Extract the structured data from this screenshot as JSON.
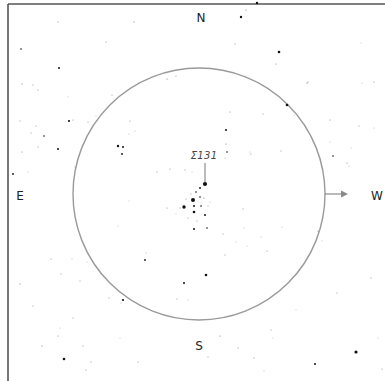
{
  "chart": {
    "width": 385,
    "height": 381,
    "background": "#ffffff",
    "frame": {
      "color": "#555555",
      "top_y": 4,
      "left_x": 8,
      "stroke_width": 1.6
    },
    "field_circle": {
      "cx": 199,
      "cy": 194,
      "r": 126,
      "color": "#9a9a9a",
      "stroke_width": 1.4
    },
    "direction_arrow": {
      "x1": 325,
      "y1": 194,
      "x2": 348,
      "y2": 194,
      "color": "#8a8a8a"
    },
    "pointer_line": {
      "x1": 205,
      "y1": 163,
      "x2": 205,
      "y2": 182,
      "color": "#666666"
    },
    "star_color": "#111111"
  },
  "labels": {
    "north": {
      "text": "N",
      "x": 201,
      "y": 18
    },
    "south": {
      "text": "S",
      "x": 199,
      "y": 346
    },
    "east": {
      "text": "E",
      "x": 20,
      "y": 196
    },
    "west": {
      "text": "W",
      "x": 377,
      "y": 196
    },
    "target": {
      "text": "Σ131",
      "x": 204,
      "y": 156
    }
  },
  "stars": [
    {
      "x": 257,
      "y": 3,
      "r": 1.2
    },
    {
      "x": 241,
      "y": 17,
      "r": 1.2
    },
    {
      "x": 246,
      "y": 10,
      "r": 0.6
    },
    {
      "x": 58,
      "y": 22,
      "r": 0.5
    },
    {
      "x": 134,
      "y": 22,
      "r": 0.6
    },
    {
      "x": 21,
      "y": 49,
      "r": 0.8
    },
    {
      "x": 106,
      "y": 42,
      "r": 0.5
    },
    {
      "x": 235,
      "y": 44,
      "r": 0.5
    },
    {
      "x": 279,
      "y": 52,
      "r": 1.3
    },
    {
      "x": 361,
      "y": 43,
      "r": 0.4
    },
    {
      "x": 59,
      "y": 68,
      "r": 1.0
    },
    {
      "x": 22,
      "y": 84,
      "r": 0.6
    },
    {
      "x": 33,
      "y": 85,
      "r": 0.5
    },
    {
      "x": 38,
      "y": 90,
      "r": 0.5
    },
    {
      "x": 68,
      "y": 97,
      "r": 0.4
    },
    {
      "x": 279,
      "y": 52,
      "r": 0.5
    },
    {
      "x": 276,
      "y": 64,
      "r": 0.5
    },
    {
      "x": 307,
      "y": 83,
      "r": 0.6
    },
    {
      "x": 374,
      "y": 82,
      "r": 0.5
    },
    {
      "x": 69,
      "y": 121,
      "r": 1.1
    },
    {
      "x": 73,
      "y": 120,
      "r": 0.5
    },
    {
      "x": 20,
      "y": 121,
      "r": 0.5
    },
    {
      "x": 36,
      "y": 126,
      "r": 0.5
    },
    {
      "x": 31,
      "y": 133,
      "r": 0.5
    },
    {
      "x": 44,
      "y": 136,
      "r": 0.8
    },
    {
      "x": 58,
      "y": 149,
      "r": 1.0
    },
    {
      "x": 38,
      "y": 147,
      "r": 0.5
    },
    {
      "x": 22,
      "y": 152,
      "r": 0.5
    },
    {
      "x": 13,
      "y": 174,
      "r": 0.9
    },
    {
      "x": 28,
      "y": 172,
      "r": 0.4
    },
    {
      "x": 112,
      "y": 95,
      "r": 0.5
    },
    {
      "x": 167,
      "y": 79,
      "r": 0.6
    },
    {
      "x": 176,
      "y": 76,
      "r": 0.5
    },
    {
      "x": 96,
      "y": 116,
      "r": 0.4
    },
    {
      "x": 130,
      "y": 121,
      "r": 0.5
    },
    {
      "x": 88,
      "y": 122,
      "r": 0.5
    },
    {
      "x": 287,
      "y": 105,
      "r": 1.3
    },
    {
      "x": 362,
      "y": 83,
      "r": 0.4
    },
    {
      "x": 308,
      "y": 82,
      "r": 0.5
    },
    {
      "x": 330,
      "y": 120,
      "r": 0.5
    },
    {
      "x": 359,
      "y": 126,
      "r": 0.5
    },
    {
      "x": 374,
      "y": 128,
      "r": 0.4
    },
    {
      "x": 230,
      "y": 112,
      "r": 0.5
    },
    {
      "x": 263,
      "y": 114,
      "r": 0.5
    },
    {
      "x": 251,
      "y": 154,
      "r": 0.5
    },
    {
      "x": 281,
      "y": 151,
      "r": 0.5
    },
    {
      "x": 330,
      "y": 142,
      "r": 0.4
    },
    {
      "x": 333,
      "y": 156,
      "r": 0.8
    },
    {
      "x": 351,
      "y": 148,
      "r": 0.4
    },
    {
      "x": 347,
      "y": 163,
      "r": 0.5
    },
    {
      "x": 118,
      "y": 146,
      "r": 1.2
    },
    {
      "x": 123,
      "y": 147,
      "r": 1.0
    },
    {
      "x": 122,
      "y": 154,
      "r": 0.9
    },
    {
      "x": 129,
      "y": 134,
      "r": 0.4
    },
    {
      "x": 135,
      "y": 131,
      "r": 0.4
    },
    {
      "x": 226,
      "y": 130,
      "r": 1.0
    },
    {
      "x": 226,
      "y": 144,
      "r": 0.6
    },
    {
      "x": 227,
      "y": 152,
      "r": 0.8
    },
    {
      "x": 225,
      "y": 158,
      "r": 0.4
    },
    {
      "x": 250,
      "y": 152,
      "r": 0.4
    },
    {
      "x": 157,
      "y": 172,
      "r": 0.5
    },
    {
      "x": 170,
      "y": 169,
      "r": 0.5
    },
    {
      "x": 185,
      "y": 170,
      "r": 0.5
    },
    {
      "x": 192,
      "y": 172,
      "r": 0.4
    },
    {
      "x": 205,
      "y": 184,
      "r": 2.1
    },
    {
      "x": 200,
      "y": 188,
      "r": 0.9
    },
    {
      "x": 196,
      "y": 192,
      "r": 0.8
    },
    {
      "x": 191,
      "y": 194,
      "r": 0.5
    },
    {
      "x": 193,
      "y": 200,
      "r": 2.0
    },
    {
      "x": 200,
      "y": 197,
      "r": 0.8
    },
    {
      "x": 204,
      "y": 198,
      "r": 0.6
    },
    {
      "x": 186,
      "y": 199,
      "r": 0.5
    },
    {
      "x": 184,
      "y": 207,
      "r": 1.7
    },
    {
      "x": 194,
      "y": 206,
      "r": 1.0
    },
    {
      "x": 201,
      "y": 206,
      "r": 0.8
    },
    {
      "x": 208,
      "y": 206,
      "r": 0.5
    },
    {
      "x": 194,
      "y": 212,
      "r": 1.3
    },
    {
      "x": 180,
      "y": 208,
      "r": 0.5
    },
    {
      "x": 205,
      "y": 215,
      "r": 1.0
    },
    {
      "x": 197,
      "y": 221,
      "r": 0.5
    },
    {
      "x": 188,
      "y": 218,
      "r": 0.5
    },
    {
      "x": 210,
      "y": 202,
      "r": 0.4
    },
    {
      "x": 176,
      "y": 214,
      "r": 0.4
    },
    {
      "x": 167,
      "y": 208,
      "r": 0.5
    },
    {
      "x": 207,
      "y": 228,
      "r": 0.8
    },
    {
      "x": 194,
      "y": 229,
      "r": 1.0
    },
    {
      "x": 243,
      "y": 209,
      "r": 0.5
    },
    {
      "x": 129,
      "y": 201,
      "r": 0.4
    },
    {
      "x": 118,
      "y": 226,
      "r": 0.4
    },
    {
      "x": 75,
      "y": 167,
      "r": 0.4
    },
    {
      "x": 223,
      "y": 234,
      "r": 0.5
    },
    {
      "x": 236,
      "y": 242,
      "r": 0.4
    },
    {
      "x": 261,
      "y": 237,
      "r": 0.4
    },
    {
      "x": 267,
      "y": 251,
      "r": 0.5
    },
    {
      "x": 225,
      "y": 255,
      "r": 0.5
    },
    {
      "x": 247,
      "y": 246,
      "r": 0.4
    },
    {
      "x": 244,
      "y": 228,
      "r": 0.4
    },
    {
      "x": 282,
      "y": 227,
      "r": 0.4
    },
    {
      "x": 318,
      "y": 231,
      "r": 0.6
    },
    {
      "x": 145,
      "y": 260,
      "r": 0.9
    },
    {
      "x": 146,
      "y": 253,
      "r": 0.4
    },
    {
      "x": 206,
      "y": 275,
      "r": 1.3
    },
    {
      "x": 184,
      "y": 283,
      "r": 1.0
    },
    {
      "x": 177,
      "y": 299,
      "r": 0.5
    },
    {
      "x": 188,
      "y": 300,
      "r": 0.4
    },
    {
      "x": 123,
      "y": 300,
      "r": 1.1
    },
    {
      "x": 121,
      "y": 303,
      "r": 0.4
    },
    {
      "x": 109,
      "y": 298,
      "r": 0.5
    },
    {
      "x": 87,
      "y": 262,
      "r": 0.4
    },
    {
      "x": 80,
      "y": 281,
      "r": 0.5
    },
    {
      "x": 51,
      "y": 259,
      "r": 0.5
    },
    {
      "x": 61,
      "y": 274,
      "r": 0.5
    },
    {
      "x": 72,
      "y": 259,
      "r": 0.4
    },
    {
      "x": 20,
      "y": 284,
      "r": 0.6
    },
    {
      "x": 33,
      "y": 306,
      "r": 0.5
    },
    {
      "x": 73,
      "y": 318,
      "r": 0.5
    },
    {
      "x": 58,
      "y": 336,
      "r": 0.5
    },
    {
      "x": 42,
      "y": 346,
      "r": 0.6
    },
    {
      "x": 83,
      "y": 346,
      "r": 0.5
    },
    {
      "x": 64,
      "y": 359,
      "r": 1.3
    },
    {
      "x": 91,
      "y": 362,
      "r": 0.5
    },
    {
      "x": 86,
      "y": 370,
      "r": 0.5
    },
    {
      "x": 60,
      "y": 328,
      "r": 0.4
    },
    {
      "x": 120,
      "y": 338,
      "r": 0.4
    },
    {
      "x": 138,
      "y": 362,
      "r": 0.5
    },
    {
      "x": 220,
      "y": 336,
      "r": 0.6
    },
    {
      "x": 238,
      "y": 348,
      "r": 0.5
    },
    {
      "x": 208,
      "y": 357,
      "r": 0.5
    },
    {
      "x": 296,
      "y": 310,
      "r": 0.4
    },
    {
      "x": 271,
      "y": 330,
      "r": 0.5
    },
    {
      "x": 273,
      "y": 338,
      "r": 0.4
    },
    {
      "x": 254,
      "y": 358,
      "r": 0.5
    },
    {
      "x": 264,
      "y": 371,
      "r": 0.4
    },
    {
      "x": 315,
      "y": 364,
      "r": 1.0
    },
    {
      "x": 356,
      "y": 352,
      "r": 1.6
    },
    {
      "x": 382,
      "y": 369,
      "r": 0.5
    },
    {
      "x": 371,
      "y": 278,
      "r": 0.5
    },
    {
      "x": 378,
      "y": 338,
      "r": 0.4
    },
    {
      "x": 337,
      "y": 293,
      "r": 0.5
    },
    {
      "x": 322,
      "y": 241,
      "r": 0.4
    },
    {
      "x": 349,
      "y": 166,
      "r": 0.4
    },
    {
      "x": 294,
      "y": 115,
      "r": 0.4
    }
  ]
}
